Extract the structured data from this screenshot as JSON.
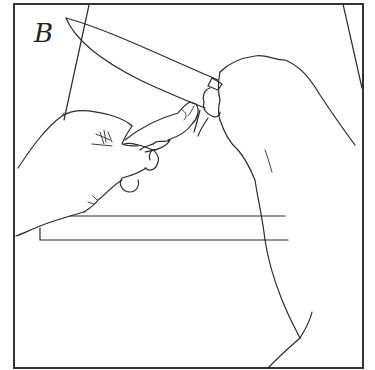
{
  "figure": {
    "panel_label": "B",
    "colors": {
      "background": "#ffffff",
      "line": "#2a2a2a"
    }
  }
}
